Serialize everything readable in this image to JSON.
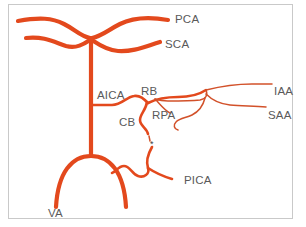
{
  "figure": {
    "type": "anatomical-diagram",
    "background_color": "#ffffff",
    "frame_color": "#c9c9c9",
    "vessel_color": "#e3491d",
    "vessel_color_thin": "#d2512a",
    "label_color": "#5a5a5a"
  },
  "labels": [
    {
      "id": "pca",
      "text": "PCA",
      "x": 175,
      "y": 14
    },
    {
      "id": "sca",
      "text": "SCA",
      "x": 165,
      "y": 39
    },
    {
      "id": "aica",
      "text": "AICA",
      "x": 97,
      "y": 90
    },
    {
      "id": "rb",
      "text": "RB",
      "x": 141,
      "y": 86
    },
    {
      "id": "iaa",
      "text": "IAA",
      "x": 274,
      "y": 86
    },
    {
      "id": "rpa",
      "text": "RPA",
      "x": 152,
      "y": 110
    },
    {
      "id": "saa",
      "text": "SAA",
      "x": 268,
      "y": 110
    },
    {
      "id": "cb",
      "text": "CB",
      "x": 119,
      "y": 117
    },
    {
      "id": "pica",
      "text": "PICA",
      "x": 184,
      "y": 175
    },
    {
      "id": "va",
      "text": "VA",
      "x": 48,
      "y": 208
    }
  ],
  "markers": [
    {
      "id": "asterisk",
      "text": "*",
      "x": 150,
      "y": 140
    }
  ],
  "legend_expansions": {
    "PCA": "posterior cerebral artery",
    "SCA": "superior cerebellar artery",
    "AICA": "anterior inferior cerebellar artery",
    "RB": "recurrent branch",
    "RPA": "recurrent perforating artery",
    "CB": "cochlear branch",
    "IAA": "internal auditory artery",
    "SAA": "subarcuate artery",
    "PICA": "posterior inferior cerebellar artery",
    "VA": "vertebral artery"
  }
}
